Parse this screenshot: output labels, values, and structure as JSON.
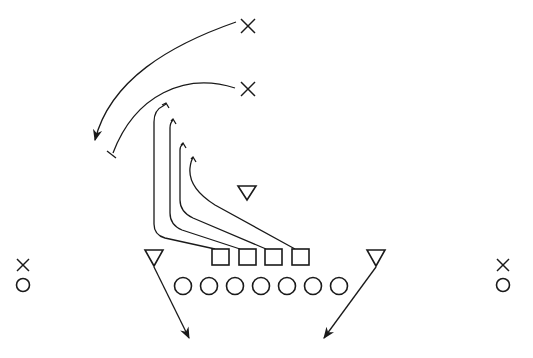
{
  "diagram": {
    "type": "football-play-diagram",
    "colors": {
      "ink": "#1a1a1a",
      "background": "#ffffff"
    },
    "offense": {
      "linemen": [
        {
          "symbol": "circle",
          "x": 183,
          "y": 286
        },
        {
          "symbol": "circle",
          "x": 209,
          "y": 286
        },
        {
          "symbol": "circle",
          "x": 235,
          "y": 286
        },
        {
          "symbol": "circle",
          "x": 261,
          "y": 286
        },
        {
          "symbol": "circle",
          "x": 287,
          "y": 286
        },
        {
          "symbol": "circle",
          "x": 313,
          "y": 286
        },
        {
          "symbol": "circle",
          "x": 339,
          "y": 286
        }
      ],
      "wide_receivers": [
        {
          "symbol": "circle",
          "x": 23,
          "y": 285,
          "side": "left"
        },
        {
          "symbol": "circle",
          "x": 503,
          "y": 285,
          "side": "right"
        }
      ]
    },
    "defense": {
      "line": [
        {
          "symbol": "square",
          "x": 220,
          "y": 257
        },
        {
          "symbol": "square",
          "x": 246,
          "y": 257
        },
        {
          "symbol": "square",
          "x": 273,
          "y": 257
        },
        {
          "symbol": "square",
          "x": 300,
          "y": 257
        }
      ],
      "linebackers": [
        {
          "symbol": "triangle",
          "x": 154,
          "y": 258,
          "route": "arrow-downright"
        },
        {
          "symbol": "triangle",
          "x": 376,
          "y": 258,
          "route": "arrow-downleft"
        },
        {
          "symbol": "triangle",
          "x": 247,
          "y": 192,
          "route": "none"
        }
      ],
      "backs": [
        {
          "symbol": "x",
          "x": 248,
          "y": 26,
          "route": "curved-arrow"
        },
        {
          "symbol": "x",
          "x": 248,
          "y": 89,
          "route": "curved-block"
        },
        {
          "symbol": "x",
          "x": 23,
          "y": 265,
          "side": "left"
        },
        {
          "symbol": "x",
          "x": 503,
          "y": 265,
          "side": "right"
        }
      ]
    },
    "routes": [
      {
        "from": "square-1",
        "type": "block",
        "end": "hook"
      },
      {
        "from": "square-2",
        "type": "block",
        "end": "hook"
      },
      {
        "from": "square-3",
        "type": "block",
        "end": "hook"
      },
      {
        "from": "square-4",
        "type": "block",
        "end": "hook"
      }
    ]
  }
}
